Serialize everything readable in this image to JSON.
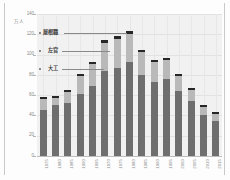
{
  "chart_data": {
    "type": "bar",
    "stacked": true,
    "title": "",
    "xlabel": "",
    "ylabel": "万人",
    "yunit": "万人",
    "ylim": [
      0,
      140
    ],
    "yticks": [
      0,
      20,
      40,
      60,
      80,
      100,
      120,
      140
    ],
    "ytick_labels": [
      "0",
      "20",
      "40",
      "60",
      "80",
      "100",
      "120",
      "140"
    ],
    "grid": true,
    "legend_position": "inside-left-callouts",
    "categories": [
      "1975",
      "1980",
      "1985",
      "1990",
      "1995",
      "1970",
      "1975",
      "1980",
      "1985",
      "1990",
      "1995",
      "2000",
      "2005",
      "2010",
      "2015"
    ],
    "x_labels": [
      "1975",
      "1980",
      "1985",
      "1990",
      "1995",
      "1970",
      "1975",
      "1980",
      "1985",
      "1990",
      "1995",
      "2000",
      "2005",
      "2010",
      "2015"
    ],
    "series": [
      {
        "name": "大工",
        "color": "#6e6e6e",
        "values": [
          45,
          50,
          52,
          61,
          69,
          84,
          87,
          93,
          80,
          73,
          76,
          64,
          54,
          40,
          35
        ]
      },
      {
        "name": "左官",
        "color": "#b9b9b9",
        "values": [
          11,
          7,
          11,
          18,
          22,
          27,
          28,
          27,
          23,
          20,
          19,
          15,
          11,
          8,
          6
        ]
      },
      {
        "name": "屋根職",
        "color": "#262626",
        "values": [
          2,
          2,
          2,
          2,
          2,
          3,
          3,
          3,
          2,
          2,
          2,
          2,
          2,
          2,
          2
        ]
      }
    ],
    "totals": [
      58,
      59,
      65,
      81,
      93,
      114,
      118,
      123,
      105,
      95,
      97,
      81,
      67,
      50,
      43
    ],
    "annotations": [
      {
        "label": "屋根職",
        "points_to": "top-segment"
      },
      {
        "label": "左官",
        "points_to": "middle-segment"
      },
      {
        "label": "大工",
        "points_to": "bottom-segment"
      }
    ]
  },
  "callouts": {
    "yane": "屋根職",
    "sakan": "左官",
    "daiku": "大工"
  }
}
